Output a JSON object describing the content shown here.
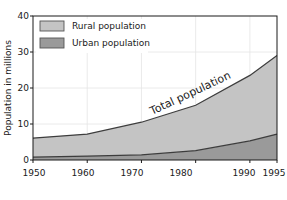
{
  "chart_data": {
    "type": "area",
    "title": "",
    "subtitle": "",
    "xlabel": "",
    "ylabel": "Population in millions",
    "xlim": [
      1950,
      1995
    ],
    "ylim": [
      0,
      40
    ],
    "grid": true,
    "stacked": true,
    "legend_position": "top-left",
    "x": [
      1950,
      1960,
      1970,
      1980,
      1990,
      1995
    ],
    "x_ticks": [
      "1950",
      "1960",
      "1970",
      "1980",
      "1990",
      "1995"
    ],
    "y_ticks": [
      "0",
      "10",
      "20",
      "30",
      "40"
    ],
    "y_tick_values": [
      0,
      10,
      20,
      30,
      40
    ],
    "annotations": [
      {
        "text": "Total population",
        "near": "upper-boundary"
      }
    ],
    "series": [
      {
        "name": "Urban population",
        "color": "#9a9a9a",
        "values": [
          0.8,
          1.1,
          1.4,
          2.6,
          5.3,
          7.2
        ]
      },
      {
        "name": "Rural population",
        "color": "#c4c4c4",
        "values": [
          5.3,
          6.1,
          9.1,
          12.6,
          18.2,
          21.8
        ]
      }
    ],
    "total_series": {
      "name": "Total population",
      "values": [
        6.1,
        7.2,
        10.5,
        15.2,
        23.5,
        29.0
      ]
    }
  },
  "legend": {
    "items": [
      {
        "label": "Rural population",
        "color": "#c4c4c4"
      },
      {
        "label": "Urban population",
        "color": "#9a9a9a"
      }
    ]
  },
  "axes": {
    "y_title": "Population in millions",
    "y_labels": [
      "40",
      "30",
      "20",
      "10",
      "0"
    ],
    "x_labels": [
      "1950",
      "1960",
      "1970",
      "1980",
      "1990",
      "1995"
    ]
  },
  "colors": {
    "rural_fill": "#c4c4c4",
    "urban_fill": "#9a9a9a",
    "axis": "#1a1a1a",
    "grid": "#e4e4e4",
    "line": "#3d3d3d",
    "background": "#ffffff"
  }
}
